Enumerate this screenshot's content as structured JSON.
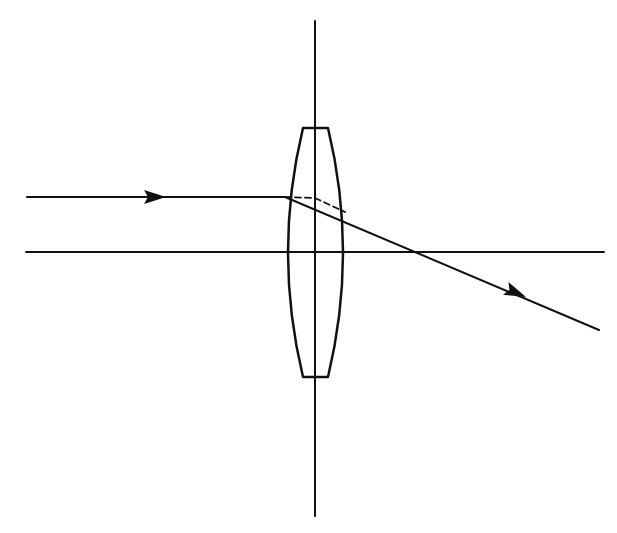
{
  "diagram": {
    "type": "optics-ray-diagram",
    "colors": {
      "background": "#ffffff",
      "stroke": "#111111"
    },
    "elements": {
      "optical_axis": {
        "x1": 26,
        "y1": 252,
        "x2": 604,
        "y2": 252
      },
      "lens_plane": {
        "x1": 315,
        "y1": 21,
        "x2": 315,
        "y2": 516
      },
      "lens": {
        "top_y": 128,
        "bottom_y": 377,
        "top_flat": [
          303,
          328
        ],
        "bottom_flat": [
          303,
          328
        ],
        "max_left_x": 285,
        "max_right_x": 346
      },
      "incident_ray": {
        "x1": 27,
        "y1": 197,
        "x2": 285,
        "y2": 197,
        "arrow_at": [
          163,
          197
        ]
      },
      "refracted_ray": {
        "x1": 285,
        "y1": 197,
        "x2": 599,
        "y2": 330,
        "crosses_axis_x": 432,
        "arrow_at": [
          526,
          297
        ]
      },
      "dashed_construction": [
        [
          285,
          197
        ],
        [
          315,
          198
        ],
        [
          345,
          212
        ]
      ]
    }
  }
}
